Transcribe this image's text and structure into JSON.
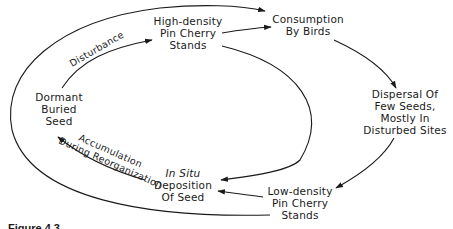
{
  "diagram": {
    "type": "cycle-flow",
    "nodes": {
      "high_density": {
        "lines": [
          "High-density",
          "Pin Cherry",
          "Stands"
        ]
      },
      "consumption": {
        "lines": [
          "Consumption",
          "By Birds"
        ]
      },
      "dispersal": {
        "lines": [
          "Dispersal Of",
          "Few Seeds,",
          "Mostly In",
          "Disturbed Sites"
        ]
      },
      "low_density": {
        "lines": [
          "Low-density",
          "Pin Cherry",
          "Stands"
        ]
      },
      "in_situ": {
        "lines": [
          "In Situ",
          "Deposition",
          "Of Seed"
        ],
        "italic_first_line": true
      },
      "dormant": {
        "lines": [
          "Dormant",
          "Buried",
          "Seed"
        ]
      }
    },
    "edge_labels": {
      "disturbance": "Disturbance",
      "accumulation": "Accumulation",
      "during_reorganization": "During Reorganization"
    },
    "edges": [
      {
        "from": "Dormant Buried Seed",
        "to": "High-density Pin Cherry Stands",
        "label": "Disturbance"
      },
      {
        "from": "High-density Pin Cherry Stands",
        "to": "Consumption By Birds"
      },
      {
        "from": "Dormant Buried Seed (outer loop)",
        "to": "Consumption By Birds"
      },
      {
        "from": "Consumption By Birds",
        "to": "Dispersal Of Few Seeds, Mostly In Disturbed Sites"
      },
      {
        "from": "Dispersal Of Few Seeds, Mostly In Disturbed Sites",
        "to": "Low-density Pin Cherry Stands"
      },
      {
        "from": "High-density Pin Cherry Stands (inner loop)",
        "to": "In Situ Deposition Of Seed"
      },
      {
        "from": "Low-density Pin Cherry Stands",
        "to": "In Situ Deposition Of Seed"
      },
      {
        "from": "In Situ Deposition Of Seed",
        "to": "Dormant Buried Seed",
        "label": "Accumulation During Reorganization"
      },
      {
        "from": "Low-density Pin Cherry Stands (outer loop)",
        "to": "Dormant Buried Seed"
      }
    ],
    "line_color": "#1a1a1a"
  },
  "caption": {
    "text": "Figure 4.3."
  }
}
